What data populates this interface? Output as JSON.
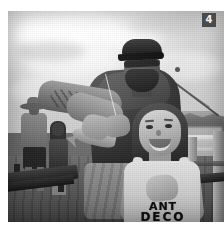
{
  "page": {
    "background_color": "#ffffff",
    "width": 224,
    "height": 227
  },
  "badge": {
    "label": "4",
    "background_color": "#4a4a4a",
    "text_color": "#f2f2f2",
    "position": "top-right"
  },
  "photo": {
    "alt": "Black and white photograph of a bearded man in a baseball cap holding a small fish while a smiling young girl stands beside him on a wooden fishing pier",
    "treatment": "black-and-white",
    "border_color": "#ffffff",
    "subjects": {
      "man": {
        "name": "man-holding-fish",
        "description": "Bearded adult man wearing a dark baseball cap and sunglasses, dark t-shirt, tattooed forearm, holding a small caught fish"
      },
      "girl": {
        "name": "smiling-girl",
        "description": "Young girl with dark hair pulled back, smiling at camera, wearing a light sleeveless graphic tank top, hands clasped at chest"
      },
      "background_man": {
        "name": "background-man-with-hat",
        "description": "Blurred man in a wide-brim hat standing on the pier at left"
      },
      "background_child": {
        "name": "background-child",
        "description": "Blurred child standing on the pier at left-center"
      }
    },
    "scene_elements": {
      "sky": "bright overcast sky with scattered clouds",
      "shoreline": "distant treeline and riverbank",
      "water": "river water with light reflections",
      "deck": "wooden pier decking planks",
      "bench": "dark wooden bench at left",
      "railing": "wooden pier railing posts and rail at right",
      "fishing_rod": "fishing rod with line angled across the upper right sky",
      "background_sign": "small illegible sign across the water"
    },
    "legible_text": {
      "shirt_line_1": "ANT",
      "shirt_line_2": "DECO",
      "background_sign": "Centro"
    }
  }
}
